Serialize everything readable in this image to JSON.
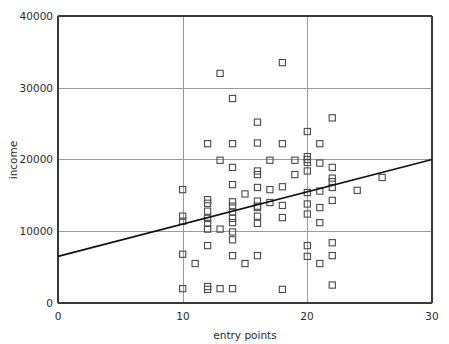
{
  "chart_data": {
    "type": "scatter",
    "title": "",
    "xlabel": "entry points",
    "ylabel": "income",
    "xlim": [
      0,
      30
    ],
    "ylim": [
      0,
      40000
    ],
    "grid": true,
    "legend": null,
    "x_ticks": [
      0,
      10,
      20,
      30
    ],
    "x_tick_labels": [
      "0",
      "10",
      "20",
      "30"
    ],
    "y_ticks": [
      0,
      10000,
      20000,
      30000,
      40000
    ],
    "y_tick_labels": [
      "0",
      "10000",
      "20000",
      "30000",
      "40000"
    ],
    "marker": "open-square",
    "marker_color": "#4a4a4a",
    "series": [
      {
        "name": "observations",
        "points": [
          [
            10,
            15800
          ],
          [
            10,
            12100
          ],
          [
            10,
            11400
          ],
          [
            10,
            6800
          ],
          [
            10,
            2000
          ],
          [
            11,
            5500
          ],
          [
            12,
            22200
          ],
          [
            12,
            14400
          ],
          [
            12,
            13900
          ],
          [
            12,
            12800
          ],
          [
            12,
            11800
          ],
          [
            12,
            11100
          ],
          [
            12,
            10300
          ],
          [
            12,
            8000
          ],
          [
            12,
            2300
          ],
          [
            12,
            1900
          ],
          [
            13,
            19900
          ],
          [
            13,
            10300
          ],
          [
            13,
            32000
          ],
          [
            13,
            2000
          ],
          [
            14,
            28500
          ],
          [
            14,
            22200
          ],
          [
            14,
            18900
          ],
          [
            14,
            16500
          ],
          [
            14,
            14100
          ],
          [
            14,
            13500
          ],
          [
            14,
            12700
          ],
          [
            14,
            11800
          ],
          [
            14,
            11200
          ],
          [
            14,
            9900
          ],
          [
            14,
            8800
          ],
          [
            14,
            6600
          ],
          [
            14,
            2000
          ],
          [
            15,
            15200
          ],
          [
            16,
            25200
          ],
          [
            16,
            22300
          ],
          [
            16,
            18400
          ],
          [
            16,
            17900
          ],
          [
            16,
            16100
          ],
          [
            16,
            14200
          ],
          [
            16,
            13500
          ],
          [
            16,
            13300
          ],
          [
            16,
            12100
          ],
          [
            16,
            11100
          ],
          [
            16,
            6600
          ],
          [
            15,
            5500
          ],
          [
            17,
            19900
          ],
          [
            17,
            15800
          ],
          [
            17,
            14000
          ],
          [
            18,
            33500
          ],
          [
            18,
            22200
          ],
          [
            18,
            16200
          ],
          [
            18,
            13600
          ],
          [
            18,
            11900
          ],
          [
            18,
            1900
          ],
          [
            19,
            19900
          ],
          [
            19,
            17900
          ],
          [
            20,
            23900
          ],
          [
            20,
            20400
          ],
          [
            20,
            20000
          ],
          [
            20,
            19600
          ],
          [
            20,
            18400
          ],
          [
            20,
            15400
          ],
          [
            20,
            13800
          ],
          [
            20,
            12400
          ],
          [
            20,
            8000
          ],
          [
            20,
            6500
          ],
          [
            21,
            22200
          ],
          [
            21,
            19500
          ],
          [
            21,
            15600
          ],
          [
            21,
            13300
          ],
          [
            21,
            11200
          ],
          [
            21,
            5500
          ],
          [
            22,
            25800
          ],
          [
            22,
            18900
          ],
          [
            22,
            17400
          ],
          [
            22,
            16900
          ],
          [
            22,
            16100
          ],
          [
            22,
            14300
          ],
          [
            22,
            8400
          ],
          [
            22,
            6600
          ],
          [
            22,
            2500
          ],
          [
            24,
            15700
          ],
          [
            26,
            17500
          ]
        ]
      }
    ],
    "trendline": {
      "name": "fitted regression line",
      "x_start": 0,
      "y_start": 6500,
      "x_end": 30,
      "y_end": 20000,
      "color": "#111111"
    }
  },
  "axes": {
    "x_axis_name": "entry points",
    "y_axis_name": "income"
  }
}
